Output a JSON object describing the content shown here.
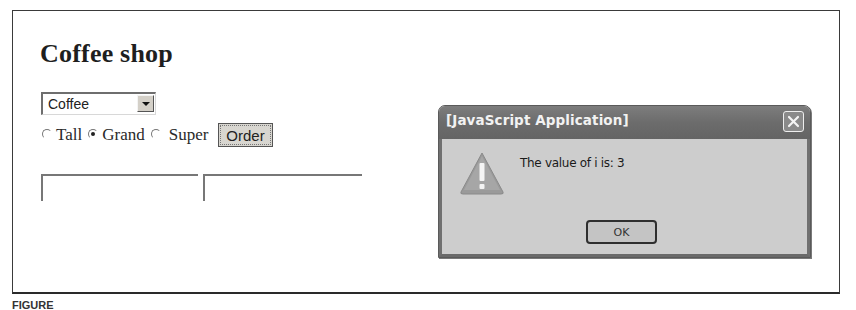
{
  "page": {
    "title": "Coffee shop",
    "drink_select": {
      "selected": "Coffee"
    },
    "sizes": [
      {
        "label": "Tall",
        "checked": false
      },
      {
        "label": "Grand",
        "checked": true
      },
      {
        "label": "Super",
        "checked": false
      }
    ],
    "order_button": "Order",
    "text_fields": [
      {
        "value": ""
      },
      {
        "value": ""
      }
    ]
  },
  "alert": {
    "title": "[JavaScript Application]",
    "message": "The value of i is: 3",
    "ok_label": "OK",
    "icon": "warning-icon"
  },
  "caption": "FIGURE"
}
